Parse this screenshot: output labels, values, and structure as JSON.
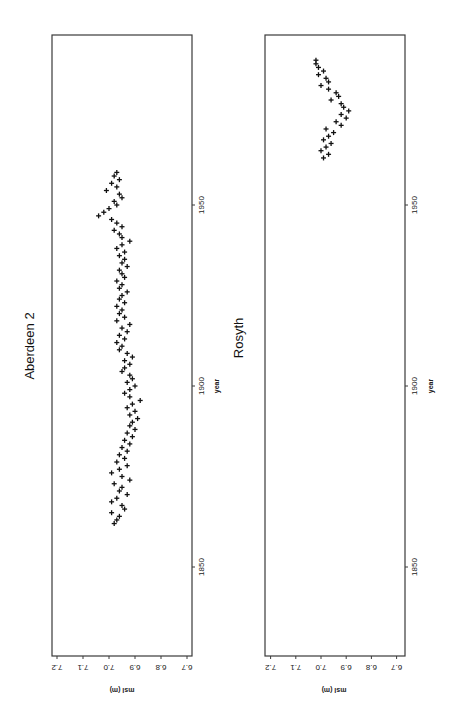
{
  "chart_data": [
    {
      "type": "scatter",
      "title": "Aberdeen 2",
      "xlabel": "year",
      "ylabel": "msl (m)",
      "orientation": "rotated 90° counter-clockwise",
      "x_ticks": [
        "1850",
        "1900",
        "1950"
      ],
      "y_ticks": [
        "6.7",
        "6.8",
        "6.9",
        "7.0",
        "7.1",
        "7.2"
      ],
      "xlim": [
        1825,
        2000
      ],
      "ylim": [
        6.7,
        7.2
      ],
      "grid": false,
      "marker": "+",
      "points": [
        [
          1862,
          6.98
        ],
        [
          1863,
          6.97
        ],
        [
          1864,
          6.96
        ],
        [
          1865,
          6.99
        ],
        [
          1866,
          6.94
        ],
        [
          1867,
          6.95
        ],
        [
          1868,
          6.99
        ],
        [
          1869,
          6.97
        ],
        [
          1870,
          6.93
        ],
        [
          1871,
          6.96
        ],
        [
          1872,
          6.95
        ],
        [
          1873,
          6.98
        ],
        [
          1874,
          6.92
        ],
        [
          1875,
          6.95
        ],
        [
          1876,
          6.99
        ],
        [
          1877,
          6.96
        ],
        [
          1878,
          6.93
        ],
        [
          1879,
          6.97
        ],
        [
          1880,
          6.94
        ],
        [
          1881,
          6.96
        ],
        [
          1882,
          6.93
        ],
        [
          1883,
          6.95
        ],
        [
          1884,
          6.92
        ],
        [
          1885,
          6.94
        ],
        [
          1886,
          6.91
        ],
        [
          1887,
          6.93
        ],
        [
          1888,
          6.9
        ],
        [
          1889,
          6.92
        ],
        [
          1890,
          6.91
        ],
        [
          1891,
          6.89
        ],
        [
          1892,
          6.92
        ],
        [
          1893,
          6.9
        ],
        [
          1894,
          6.93
        ],
        [
          1895,
          6.91
        ],
        [
          1896,
          6.88
        ],
        [
          1897,
          6.92
        ],
        [
          1898,
          6.94
        ],
        [
          1899,
          6.92
        ],
        [
          1900,
          6.9
        ],
        [
          1901,
          6.93
        ],
        [
          1902,
          6.91
        ],
        [
          1903,
          6.92
        ],
        [
          1904,
          6.95
        ],
        [
          1905,
          6.94
        ],
        [
          1906,
          6.92
        ],
        [
          1907,
          6.94
        ],
        [
          1908,
          6.91
        ],
        [
          1909,
          6.93
        ],
        [
          1910,
          6.96
        ],
        [
          1911,
          6.95
        ],
        [
          1912,
          6.97
        ],
        [
          1913,
          6.94
        ],
        [
          1914,
          6.96
        ],
        [
          1915,
          6.93
        ],
        [
          1916,
          6.95
        ],
        [
          1917,
          6.92
        ],
        [
          1918,
          6.97
        ],
        [
          1919,
          6.94
        ],
        [
          1920,
          6.96
        ],
        [
          1921,
          6.95
        ],
        [
          1922,
          6.97
        ],
        [
          1923,
          6.94
        ],
        [
          1924,
          6.96
        ],
        [
          1925,
          6.95
        ],
        [
          1926,
          6.93
        ],
        [
          1927,
          6.96
        ],
        [
          1928,
          6.95
        ],
        [
          1929,
          6.97
        ],
        [
          1930,
          6.94
        ],
        [
          1931,
          6.95
        ],
        [
          1932,
          6.96
        ],
        [
          1933,
          6.93
        ],
        [
          1934,
          6.95
        ],
        [
          1935,
          6.94
        ],
        [
          1936,
          6.96
        ],
        [
          1937,
          6.94
        ],
        [
          1938,
          6.97
        ],
        [
          1939,
          6.95
        ],
        [
          1940,
          6.92
        ],
        [
          1941,
          6.95
        ],
        [
          1942,
          6.96
        ],
        [
          1943,
          6.98
        ],
        [
          1944,
          6.95
        ],
        [
          1945,
          6.97
        ],
        [
          1946,
          6.99
        ],
        [
          1947,
          7.04
        ],
        [
          1948,
          7.02
        ],
        [
          1949,
          7.0
        ],
        [
          1950,
          6.97
        ],
        [
          1951,
          6.98
        ],
        [
          1952,
          6.95
        ],
        [
          1953,
          6.96
        ],
        [
          1954,
          7.01
        ],
        [
          1955,
          6.97
        ],
        [
          1956,
          6.99
        ],
        [
          1957,
          6.96
        ],
        [
          1958,
          6.98
        ],
        [
          1959,
          6.97
        ]
      ]
    },
    {
      "type": "scatter",
      "title": "Rosyth",
      "xlabel": "year",
      "ylabel": "msl (m)",
      "orientation": "rotated 90° counter-clockwise",
      "x_ticks": [
        "1850",
        "1900",
        "1950"
      ],
      "y_ticks": [
        "6.7",
        "6.8",
        "6.9",
        "7.0",
        "7.1",
        "7.2"
      ],
      "xlim": [
        1825,
        2000
      ],
      "ylim": [
        6.7,
        7.2
      ],
      "grid": false,
      "marker": "+",
      "points": [
        [
          1963,
          6.99
        ],
        [
          1964,
          6.97
        ],
        [
          1965,
          7.0
        ],
        [
          1966,
          6.98
        ],
        [
          1967,
          6.96
        ],
        [
          1968,
          6.99
        ],
        [
          1969,
          6.97
        ],
        [
          1970,
          6.95
        ],
        [
          1971,
          6.98
        ],
        [
          1972,
          6.92
        ],
        [
          1973,
          6.94
        ],
        [
          1974,
          6.9
        ],
        [
          1975,
          6.92
        ],
        [
          1976,
          6.89
        ],
        [
          1977,
          6.91
        ],
        [
          1978,
          6.92
        ],
        [
          1979,
          6.96
        ],
        [
          1980,
          6.93
        ],
        [
          1981,
          6.94
        ],
        [
          1982,
          6.97
        ],
        [
          1983,
          7.0
        ],
        [
          1984,
          6.97
        ],
        [
          1985,
          6.98
        ],
        [
          1986,
          7.01
        ],
        [
          1987,
          6.99
        ],
        [
          1988,
          7.01
        ],
        [
          1989,
          7.02
        ],
        [
          1990,
          7.02
        ]
      ]
    }
  ],
  "panels": {
    "aberdeen": {
      "title": "Aberdeen 2",
      "x_axis_label": "year",
      "y_axis_label": "msl (m)",
      "year_ticks": [
        {
          "label": "1850",
          "year": 1850
        },
        {
          "label": "1900",
          "year": 1900
        },
        {
          "label": "1950",
          "year": 1950
        }
      ],
      "msl_ticks": [
        {
          "label": "7.2",
          "value": 7.2
        },
        {
          "label": "7.1",
          "value": 7.1
        },
        {
          "label": "7.0",
          "value": 7.0
        },
        {
          "label": "6.9",
          "value": 6.9
        },
        {
          "label": "6.8",
          "value": 6.8
        },
        {
          "label": "6.7",
          "value": 6.7
        }
      ]
    },
    "rosyth": {
      "title": "Rosyth",
      "x_axis_label": "year",
      "y_axis_label": "msl (m)",
      "year_ticks": [
        {
          "label": "1850",
          "year": 1850
        },
        {
          "label": "1900",
          "year": 1900
        },
        {
          "label": "1950",
          "year": 1950
        }
      ],
      "msl_ticks": [
        {
          "label": "7.2",
          "value": 7.2
        },
        {
          "label": "7.1",
          "value": 7.1
        },
        {
          "label": "7.0",
          "value": 7.0
        },
        {
          "label": "6.9",
          "value": 6.9
        },
        {
          "label": "6.8",
          "value": 6.8
        },
        {
          "label": "6.7",
          "value": 6.7
        }
      ]
    }
  },
  "colors": {
    "frame": "#3a3a3a",
    "marker": "#111111",
    "background": "#ffffff"
  }
}
